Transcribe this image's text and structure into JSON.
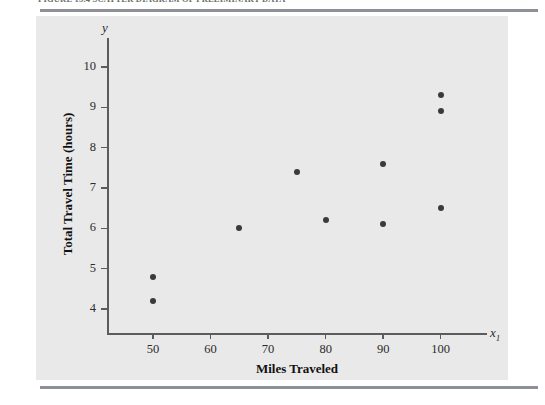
{
  "figure": {
    "caption": "FIGURE 15.4   SCATTER DIAGRAM OF PRELIMINARY DATA"
  },
  "chart_data": {
    "type": "scatter",
    "title": "",
    "xlabel": "Miles Traveled",
    "ylabel": "Total Travel Time (hours)",
    "x_axis_symbol": "x",
    "x_axis_subscript": "1",
    "y_axis_symbol": "y",
    "xlim": [
      42,
      107
    ],
    "ylim": [
      3.4,
      10.6
    ],
    "xticks": [
      50,
      60,
      70,
      80,
      90,
      100
    ],
    "yticks": [
      4,
      5,
      6,
      7,
      8,
      9,
      10
    ],
    "grid": false,
    "legend": null,
    "marker_color": "#3a3a3a",
    "panel_color": "#e9e9e9",
    "points": [
      {
        "x": 50,
        "y": 4.8
      },
      {
        "x": 50,
        "y": 4.2
      },
      {
        "x": 65,
        "y": 6.0
      },
      {
        "x": 75,
        "y": 7.4
      },
      {
        "x": 80,
        "y": 6.2
      },
      {
        "x": 90,
        "y": 7.6
      },
      {
        "x": 90,
        "y": 6.1
      },
      {
        "x": 100,
        "y": 9.3
      },
      {
        "x": 100,
        "y": 8.9
      },
      {
        "x": 100,
        "y": 6.5
      }
    ]
  }
}
